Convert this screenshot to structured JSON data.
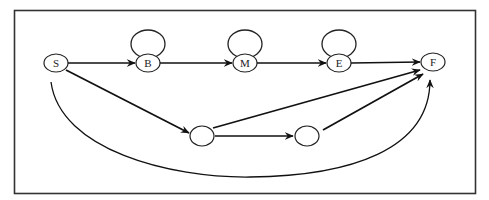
{
  "diagram": {
    "type": "state-transition-graph",
    "nodes": [
      {
        "id": "S",
        "label": "S",
        "cx": 56,
        "cy": 63
      },
      {
        "id": "B",
        "label": "B",
        "cx": 148,
        "cy": 63,
        "self_loop": true
      },
      {
        "id": "M",
        "label": "M",
        "cx": 245,
        "cy": 63,
        "self_loop": true
      },
      {
        "id": "E",
        "label": "E",
        "cx": 339,
        "cy": 63,
        "self_loop": true
      },
      {
        "id": "F",
        "label": "F",
        "cx": 433,
        "cy": 62
      },
      {
        "id": "X1",
        "label": "",
        "cx": 202,
        "cy": 136
      },
      {
        "id": "X2",
        "label": "",
        "cx": 307,
        "cy": 136
      }
    ],
    "edges": [
      {
        "from": "S",
        "to": "B"
      },
      {
        "from": "B",
        "to": "M"
      },
      {
        "from": "M",
        "to": "E"
      },
      {
        "from": "E",
        "to": "F"
      },
      {
        "from": "B",
        "to": "B"
      },
      {
        "from": "M",
        "to": "M"
      },
      {
        "from": "E",
        "to": "E"
      },
      {
        "from": "S",
        "to": "X1"
      },
      {
        "from": "X1",
        "to": "X2"
      },
      {
        "from": "X1",
        "to": "F"
      },
      {
        "from": "X2",
        "to": "F"
      },
      {
        "from": "S",
        "to": "F",
        "curved": true
      }
    ],
    "colors": {
      "stroke": "#111111",
      "background": "#ffffff"
    }
  }
}
